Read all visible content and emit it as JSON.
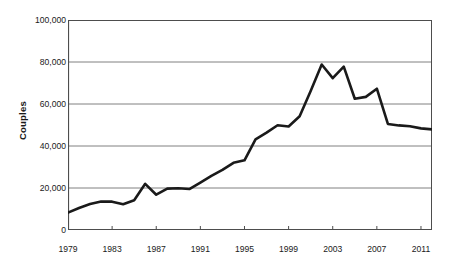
{
  "chart_data": {
    "type": "line",
    "title": "",
    "xlabel": "",
    "ylabel": "Couples",
    "ylim": [
      0,
      100000
    ],
    "xlim": [
      1979,
      2012
    ],
    "grid": true,
    "legend": false,
    "y_ticks": [
      "0",
      "20,000",
      "40,000",
      "60,000",
      "80,000",
      "100,000"
    ],
    "y_tick_values": [
      0,
      20000,
      40000,
      60000,
      80000,
      100000
    ],
    "x_ticks": [
      "1979",
      "1983",
      "1987",
      "1991",
      "1995",
      "1999",
      "2003",
      "2007",
      "2011"
    ],
    "x_tick_values": [
      1979,
      1983,
      1987,
      1991,
      1995,
      1999,
      2003,
      2007,
      2011
    ],
    "line_color": "#1a1a1a",
    "line_width": 2.6,
    "axis_color": "#4d4d4d",
    "grid_color": "#808080",
    "x": [
      1979,
      1980,
      1981,
      1982,
      1983,
      1984,
      1985,
      1986,
      1987,
      1988,
      1989,
      1990,
      1991,
      1992,
      1993,
      1994,
      1995,
      1996,
      1997,
      1998,
      1999,
      2000,
      2001,
      2002,
      2003,
      2004,
      2005,
      2006,
      2007,
      2008,
      2009,
      2010,
      2011,
      2012
    ],
    "series": [
      {
        "name": "Couples",
        "values": [
          8300,
          10500,
          12400,
          13600,
          13500,
          12300,
          14200,
          22000,
          16800,
          19700,
          19900,
          19500,
          22600,
          25800,
          28600,
          32000,
          33200,
          43200,
          46400,
          49900,
          49300,
          54200,
          66200,
          78800,
          72300,
          77800,
          62500,
          63400,
          67300,
          50500,
          49800,
          49400,
          48400,
          47900
        ]
      }
    ]
  }
}
